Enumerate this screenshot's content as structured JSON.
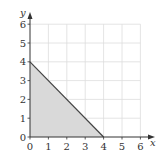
{
  "chart_data": {
    "type": "area",
    "title": "",
    "xlabel": "x",
    "ylabel": "y",
    "xlim": [
      0,
      6
    ],
    "ylim": [
      0,
      6
    ],
    "x_ticks": [
      "0",
      "1",
      "2",
      "3",
      "4",
      "5",
      "6"
    ],
    "y_ticks": [
      "0",
      "1",
      "2",
      "3",
      "4",
      "5",
      "6"
    ],
    "grid": true,
    "series": [
      {
        "name": "shaded region",
        "description": "Triangle bounded by x=0, y=0 and line x + y = 4",
        "points": [
          [
            0,
            0
          ],
          [
            0,
            4
          ],
          [
            4,
            0
          ]
        ],
        "fill": "#d9d9d9",
        "line_points": [
          [
            0,
            4
          ],
          [
            4,
            0
          ]
        ]
      }
    ]
  },
  "colors": {
    "fill": "#d9d9d9",
    "grid": "#dddddd",
    "axis": "#333333",
    "line": "#444444"
  }
}
